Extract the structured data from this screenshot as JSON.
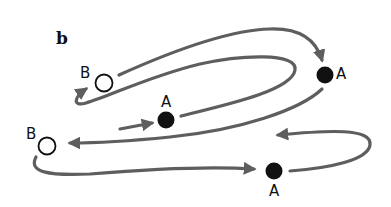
{
  "figure": {
    "panel_label": "b",
    "colors": {
      "path": "#5e5e5e",
      "node_fill_A": "#111111",
      "node_fill_B": "#ffffff",
      "node_stroke": "#111111"
    },
    "nodes": [
      {
        "id": "A1",
        "label": "A",
        "type": "filled",
        "x": 166,
        "y": 120
      },
      {
        "id": "B1",
        "label": "B",
        "type": "open",
        "x": 104,
        "y": 83
      },
      {
        "id": "A2",
        "label": "A",
        "type": "filled",
        "x": 325,
        "y": 75
      },
      {
        "id": "B2",
        "label": "B",
        "type": "open",
        "x": 47,
        "y": 146
      },
      {
        "id": "A3",
        "label": "A",
        "type": "filled",
        "x": 274,
        "y": 171
      }
    ],
    "edges": [
      {
        "from": "start",
        "to": "A1"
      },
      {
        "from": "A1",
        "to": "B1"
      },
      {
        "from": "B1",
        "to": "A2"
      },
      {
        "from": "A2",
        "to": "B2"
      },
      {
        "from": "B2",
        "to": "A3"
      },
      {
        "from": "A3",
        "to": "loop-end"
      }
    ]
  }
}
